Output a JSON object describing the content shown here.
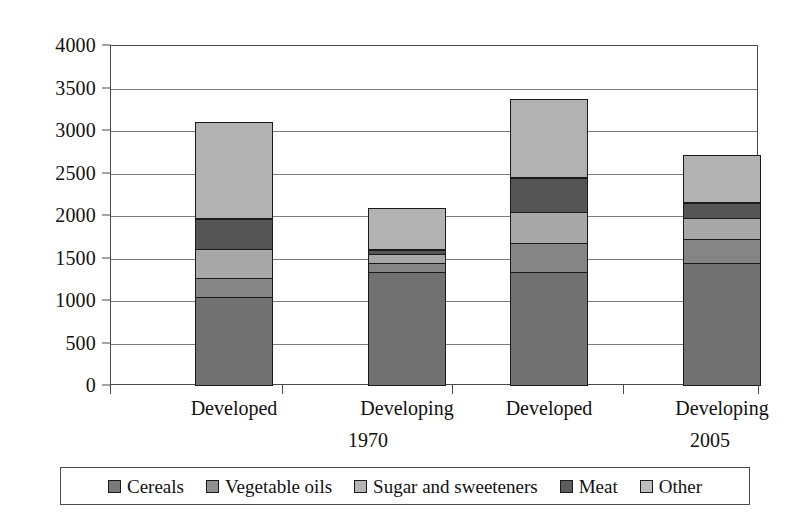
{
  "chart_data": {
    "type": "bar",
    "subtype": "stacked-vertical",
    "title": "",
    "subtitle": "",
    "xlabel": "",
    "ylabel": "",
    "ylim": [
      0,
      4000
    ],
    "ytick_step": 500,
    "yticks": [
      0,
      500,
      1000,
      1500,
      2000,
      2500,
      3000,
      3500,
      4000
    ],
    "ytick_labels": [
      "0",
      "500",
      "1000",
      "1500",
      "2000",
      "2500",
      "3000",
      "3500",
      "4000"
    ],
    "grid": true,
    "grid_axis": "y",
    "legend_position": "bottom",
    "categories": [
      "Developed",
      "Developing",
      "Developed",
      "Developing"
    ],
    "group_labels": [
      "1970",
      "2005"
    ],
    "groups": [
      {
        "label": "1970",
        "categories": [
          "Developed",
          "Developing"
        ]
      },
      {
        "label": "2005",
        "categories": [
          "Developed",
          "Developing"
        ]
      }
    ],
    "series": [
      {
        "name": "Cereals",
        "color": "#7a7a7a",
        "values": [
          1050,
          1350,
          1340,
          1450
        ]
      },
      {
        "name": "Vegetable oils",
        "color": "#8f8f8f",
        "values": [
          240,
          110,
          360,
          300
        ]
      },
      {
        "name": "Sugar and sweeteners",
        "color": "#b4b4b4",
        "values": [
          350,
          130,
          380,
          260
        ]
      },
      {
        "name": "Meat",
        "color": "#5c5c5c",
        "values": [
          370,
          60,
          410,
          190
        ]
      },
      {
        "name": "Other",
        "color": "#bfbfbf",
        "values": [
          1140,
          490,
          930,
          560
        ]
      }
    ],
    "totals": [
      3150,
      2140,
      3420,
      2760
    ]
  },
  "legend": {
    "items": [
      {
        "label": "Cereals",
        "color": "#7a7a7a"
      },
      {
        "label": "Vegetable oils",
        "color": "#8f8f8f"
      },
      {
        "label": "Sugar and sweeteners",
        "color": "#b4b4b4"
      },
      {
        "label": "Meat",
        "color": "#5c5c5c"
      },
      {
        "label": "Other",
        "color": "#bfbfbf"
      }
    ]
  },
  "colors": {
    "axis": "#4a4a4a",
    "grid": "#7d7d7d",
    "bar_outline": "#1b1b1b",
    "background": "#ffffff",
    "text": "#111111"
  }
}
